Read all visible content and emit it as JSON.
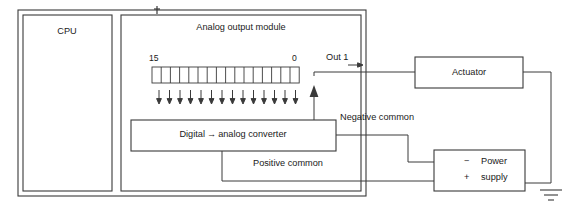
{
  "diagram": {
    "type": "block-diagram",
    "colors": {
      "background": "#ffffff",
      "line": "#3a3a3a",
      "text": "#1a1a1a"
    },
    "rack": {
      "cpu": {
        "label": "CPU"
      },
      "module": {
        "title": "Analog output module",
        "register": {
          "msb_label": "15",
          "lsb_label": "0",
          "bit_count": 16,
          "arrow_count": 14
        },
        "converter": {
          "label_left": "Digital",
          "label_arrow": "→",
          "label_right": "analog converter",
          "label_full": "Digital → analog converter"
        },
        "output_terminal": {
          "label": "Out 1"
        }
      }
    },
    "wires": {
      "negative_common": "Negative common",
      "positive_common": "Positive common"
    },
    "actuator": {
      "label": "Actuator"
    },
    "power_supply": {
      "line1_sign": "−",
      "line1_text": "Power",
      "line2_sign": "+",
      "line2_text": "supply",
      "label_full": "Power supply"
    },
    "ground": {
      "symbol_name": "earth-ground"
    }
  }
}
